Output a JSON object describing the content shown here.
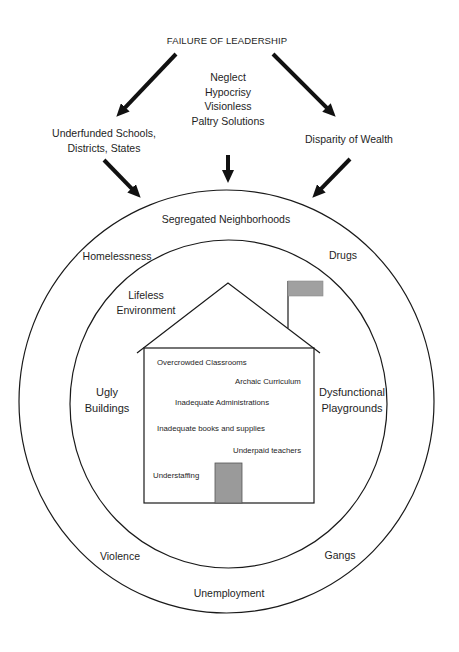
{
  "diagram": {
    "title": "FAILURE OF LEADERSHIP",
    "leadership_failures": [
      "Neglect",
      "Hypocrisy",
      "Visionless",
      "Paltry Solutions"
    ],
    "left_branch": [
      "Underfunded Schools,",
      "Districts, States"
    ],
    "right_branch": "Disparity of Wealth",
    "outer_ring": {
      "top": "Segregated Neighborhoods",
      "upper_left": "Homelessness",
      "upper_right": "Drugs",
      "lower_left": "Violence",
      "lower_right": "Gangs",
      "bottom": "Unemployment"
    },
    "inner_ring": {
      "upper_left": [
        "Lifeless",
        "Environment"
      ],
      "left": [
        "Ugly",
        "Buildings"
      ],
      "right": [
        "Dysfunctional",
        "Playgrounds"
      ]
    },
    "school": {
      "items": [
        "Overcrowded Classrooms",
        "Archaic Curriculum",
        "Inadequate Administrations",
        "Inadequate books and supplies",
        "Underpaid teachers",
        "Understaffing"
      ]
    },
    "colors": {
      "line": "#1a1a1a",
      "text": "#1e1e1e",
      "door": "#9a9a9a",
      "flag": "#a0a0a0"
    }
  }
}
